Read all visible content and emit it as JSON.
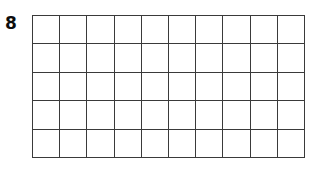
{
  "page": {
    "background_color": "#ffffff",
    "width": 319,
    "height": 170
  },
  "item": {
    "number_label": "8"
  },
  "grid": {
    "columns": 10,
    "rows": 5,
    "total_cells": 50,
    "fill_color": "#ffffff",
    "line_color": "#3a3a3a",
    "line_width_px": 1.3,
    "cell_width_px": 27.3,
    "cell_height_px": 28.6,
    "origin_x_px": 32,
    "origin_y_px": 15,
    "width_px": 273,
    "height_px": 143,
    "shaded_cells": [],
    "cell_labels": []
  },
  "chart_data": {
    "type": "heatmap",
    "title": "",
    "xlabel": "",
    "ylabel": "",
    "columns": 10,
    "rows": 5,
    "categories": [
      "1",
      "2",
      "3",
      "4",
      "5",
      "6",
      "7",
      "8",
      "9",
      "10"
    ],
    "row_labels": [
      "1",
      "2",
      "3",
      "4",
      "5"
    ],
    "series": [
      {
        "name": "row-1",
        "values": [
          0,
          0,
          0,
          0,
          0,
          0,
          0,
          0,
          0,
          0
        ]
      },
      {
        "name": "row-2",
        "values": [
          0,
          0,
          0,
          0,
          0,
          0,
          0,
          0,
          0,
          0
        ]
      },
      {
        "name": "row-3",
        "values": [
          0,
          0,
          0,
          0,
          0,
          0,
          0,
          0,
          0,
          0
        ]
      },
      {
        "name": "row-4",
        "values": [
          0,
          0,
          0,
          0,
          0,
          0,
          0,
          0,
          0,
          0
        ]
      },
      {
        "name": "row-5",
        "values": [
          0,
          0,
          0,
          0,
          0,
          0,
          0,
          0,
          0,
          0
        ]
      }
    ],
    "grid": true,
    "legend": false,
    "annotations": [
      "8"
    ]
  }
}
